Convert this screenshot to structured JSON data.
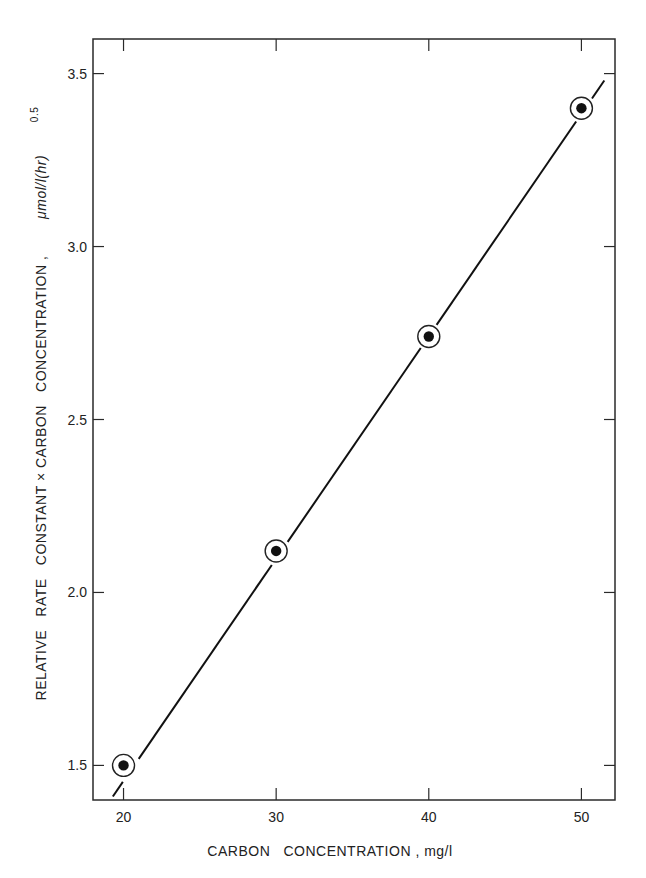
{
  "chart_data": {
    "type": "scatter",
    "title": "",
    "xlabel": "CARBON   CONCENTRATION , mg/l",
    "ylabel": "RELATIVE   RATE   CONSTANT × CARBON   CONCENTRATION ,",
    "ylabel_unit": "μmol/l(hr)",
    "ylabel_unit_exponent": "0.5",
    "xlim": [
      18,
      52.2
    ],
    "ylim": [
      1.4,
      3.6
    ],
    "xticks": [
      20,
      30,
      40,
      50
    ],
    "xtick_labels": [
      "20",
      "30",
      "40",
      "50"
    ],
    "yticks": [
      1.5,
      2.0,
      2.5,
      3.0,
      3.5
    ],
    "ytick_labels": [
      "1.5",
      "2.0",
      "2.5",
      "3.0",
      "3.5"
    ],
    "grid": false,
    "legend": null,
    "series": [
      {
        "name": "measured",
        "marker": "circled-dot",
        "x": [
          20,
          30,
          40,
          50
        ],
        "y": [
          1.5,
          2.12,
          2.74,
          3.4
        ]
      }
    ],
    "fit_line": {
      "type": "linear",
      "x": [
        19.3,
        51.5
      ],
      "y": [
        1.41,
        3.48
      ]
    }
  }
}
